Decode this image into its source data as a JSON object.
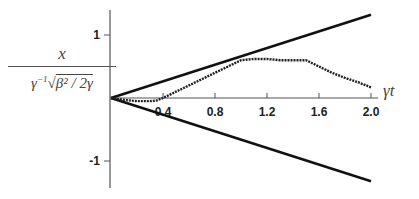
{
  "chart_data": {
    "type": "line",
    "title": "",
    "xlabel": "γt",
    "ylabel": "x / (γ⁻¹ √(β²/2γ))",
    "xlim": [
      0,
      2.05
    ],
    "ylim": [
      -1.4,
      1.4
    ],
    "x_ticks": [
      "0.4",
      "0.8",
      "1.2",
      "1.6",
      "2.0"
    ],
    "y_ticks": [
      "1",
      "-1"
    ],
    "grid": false,
    "legend": null,
    "series": [
      {
        "name": "upper bound",
        "style": "solid thick",
        "x": [
          0,
          2.0
        ],
        "y": [
          0,
          1.32
        ]
      },
      {
        "name": "lower bound",
        "style": "solid thick",
        "x": [
          0,
          2.0
        ],
        "y": [
          0,
          -1.32
        ]
      },
      {
        "name": "trajectory",
        "style": "dotted markers",
        "x": [
          0,
          0.1,
          0.2,
          0.3,
          0.35,
          0.4,
          0.5,
          0.6,
          0.7,
          0.8,
          0.9,
          1.0,
          1.1,
          1.2,
          1.3,
          1.4,
          1.5,
          1.6,
          1.7,
          1.8,
          1.9,
          2.0
        ],
        "y": [
          0,
          -0.03,
          -0.05,
          -0.05,
          -0.04,
          0.0,
          0.1,
          0.2,
          0.3,
          0.4,
          0.5,
          0.6,
          0.62,
          0.62,
          0.6,
          0.6,
          0.6,
          0.5,
          0.4,
          0.32,
          0.25,
          0.17
        ]
      }
    ]
  },
  "labels": {
    "ylabel_num": "x",
    "ylabel_den_gamma": "γ",
    "ylabel_den_exp": "−1",
    "ylabel_den_sqrt": "√",
    "ylabel_den_inner": "β² / 2γ",
    "xlabel": "γt"
  }
}
